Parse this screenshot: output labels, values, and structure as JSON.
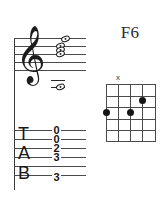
{
  "chord": {
    "name": "F6",
    "instrument": "guitar"
  },
  "notation": {
    "clef_glyph": "𝄞",
    "clef_name": "treble-clef",
    "staff_line_count": 5,
    "staff_lines_y": [
      0,
      8,
      16,
      24,
      32
    ],
    "noteheads": [
      {
        "id": "note-1",
        "x": 9,
        "y": 1.0
      },
      {
        "id": "note-2",
        "x": 4,
        "y": 8.0
      },
      {
        "id": "note-3",
        "x": 4,
        "y": 12.0
      },
      {
        "id": "note-4",
        "x": 4,
        "y": 16.0
      },
      {
        "id": "note-5",
        "x": 4,
        "y": 48.0
      }
    ],
    "ledger_lines_y": [
      42,
      49
    ],
    "ledger_x": -1
  },
  "tab": {
    "label_letters": [
      "T",
      "A",
      "B"
    ],
    "line_count": 6,
    "lines_y": [
      92,
      101,
      110,
      119,
      128,
      137
    ],
    "frets": [
      {
        "string": 1,
        "value": "0",
        "y": 87
      },
      {
        "string": 2,
        "value": "0",
        "y": 96
      },
      {
        "string": 3,
        "value": "2",
        "y": 105
      },
      {
        "string": 4,
        "value": "3",
        "y": 114
      },
      {
        "string": 5,
        "value": "",
        "y": 123
      },
      {
        "string": 6,
        "value": "3",
        "y": 134
      }
    ]
  },
  "diagram": {
    "string_count": 5,
    "fret_count": 5,
    "string_x": [
      0,
      12,
      24,
      36,
      49
    ],
    "fret_y": [
      0,
      11.5,
      23,
      34.5,
      46,
      57
    ],
    "dots": [
      {
        "id": "dot-1",
        "x": 0,
        "y": 28
      },
      {
        "id": "dot-2",
        "x": 24,
        "y": 28
      },
      {
        "id": "dot-3",
        "x": 36,
        "y": 17
      }
    ],
    "markers": [
      {
        "id": "marker-x",
        "symbol": "x",
        "x": 12,
        "y": -9
      }
    ]
  },
  "colors": {
    "ink": "#151515",
    "staff": "#4a4a4a",
    "grid": "#4b4b4b",
    "background": "#ffffff"
  }
}
